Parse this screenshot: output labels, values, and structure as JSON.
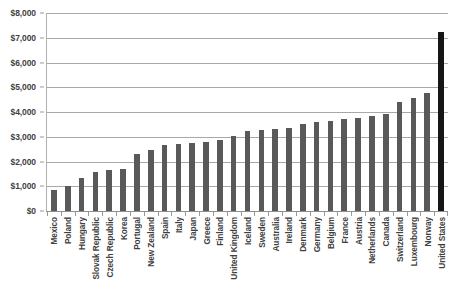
{
  "chart_data": {
    "type": "bar",
    "title": "",
    "subtitle": "",
    "xlabel": "",
    "ylabel": "",
    "ylim": [
      0,
      8000
    ],
    "grid": true,
    "legend": false,
    "y_ticks": [
      "$0",
      "$1,000",
      "$2,000",
      "$3,000",
      "$4,000",
      "$5,000",
      "$6,000",
      "$7,000",
      "$8,000"
    ],
    "y_tick_values": [
      0,
      1000,
      2000,
      3000,
      4000,
      5000,
      6000,
      7000,
      8000
    ],
    "categories": [
      "Mexico",
      "Poland",
      "Hungary",
      "Slovak Republic",
      "Czech Republic",
      "Korea",
      "Portugal",
      "New Zealand",
      "Spain",
      "Italy",
      "Japan",
      "Greece",
      "Finland",
      "United Kingdom",
      "Iceland",
      "Sweden",
      "Australia",
      "Ireland",
      "Denmark",
      "Germany",
      "Belgium",
      "France",
      "Austria",
      "Netherlands",
      "Canada",
      "Switzerland",
      "Luxembourg",
      "Norway",
      "United States"
    ],
    "values": [
      850,
      1020,
      1350,
      1560,
      1650,
      1700,
      2300,
      2450,
      2650,
      2700,
      2750,
      2800,
      2850,
      3050,
      3250,
      3280,
      3300,
      3350,
      3500,
      3600,
      3650,
      3700,
      3750,
      3850,
      3900,
      4400,
      4550,
      4750,
      7250
    ],
    "highlight_index": 28,
    "colors": {
      "bar": "#595959",
      "bar_highlight": "#161616",
      "gridline": "#a8a8a8",
      "axis": "#8f8f8f",
      "text": "#3f3f3f",
      "background": "#ffffff"
    }
  }
}
